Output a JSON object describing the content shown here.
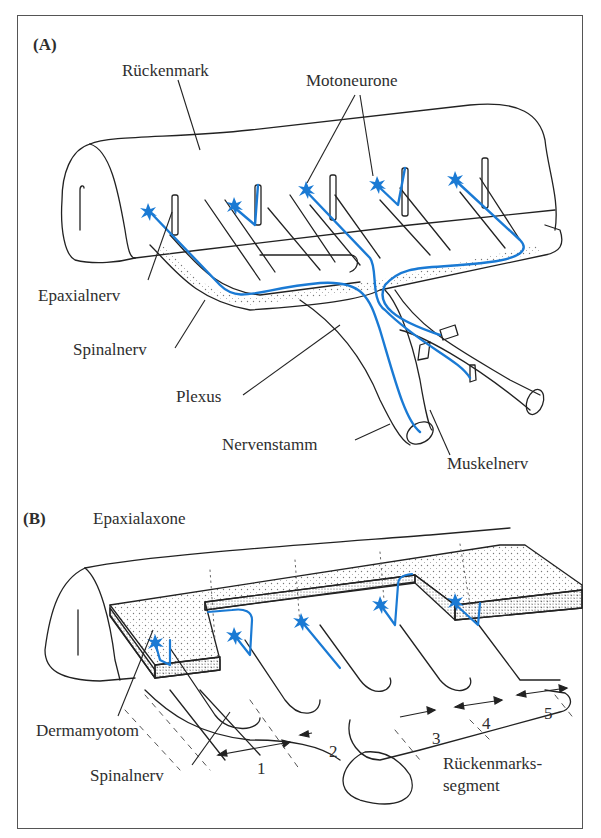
{
  "colors": {
    "axon_blue": "#1a7ad4",
    "line": "#222222",
    "frame": "#555555",
    "stipple": "#888888"
  },
  "panel_a": {
    "tag": "(A)",
    "labels": {
      "rueckenmark": "Rückenmark",
      "motoneurone": "Motoneurone",
      "epaxialnerv": "Epaxialnerv",
      "spinalnerv": "Spinalnerv",
      "plexus": "Plexus",
      "nervenstamm": "Nervenstamm",
      "muskelnerv": "Muskelnerv"
    }
  },
  "panel_b": {
    "tag": "(B)",
    "labels": {
      "epaxialaxone": "Epaxialaxone",
      "dermamyotom": "Dermamyotom",
      "spinalnerv": "Spinalnerv",
      "segment_line1": "Rückenmarks-",
      "segment_line2": "segment"
    },
    "segments": [
      "1",
      "2",
      "3",
      "4",
      "5"
    ]
  }
}
